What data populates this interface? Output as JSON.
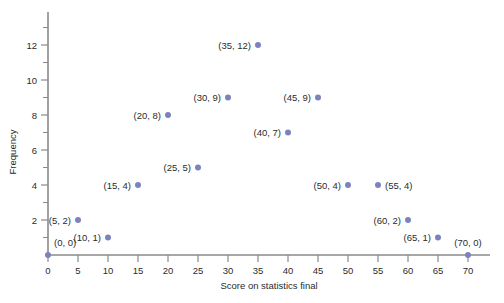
{
  "chart_data": {
    "type": "scatter",
    "title": "",
    "xlabel": "Score on statistics final",
    "ylabel": "Frequency",
    "xlim": [
      0,
      72
    ],
    "ylim": [
      0,
      13.5
    ],
    "grid": false,
    "legend": null,
    "x_ticks": [
      0,
      5,
      10,
      15,
      20,
      25,
      30,
      35,
      40,
      45,
      50,
      55,
      60,
      65,
      70
    ],
    "x_tick_labels": [
      "0",
      "5",
      "10",
      "15",
      "20",
      "25",
      "30",
      "35",
      "40",
      "45",
      "50",
      "55",
      "60",
      "65",
      "70"
    ],
    "y_ticks": [
      2,
      4,
      6,
      8,
      10,
      12
    ],
    "y_tick_labels": [
      "2",
      "4",
      "6",
      "8",
      "10",
      "12"
    ],
    "y_minor_ticks": [
      1,
      3,
      5,
      7,
      9,
      11,
      13
    ],
    "marker_color": "#7d82bf",
    "axis_color": "#8a8a8a",
    "text_color": "#2b2b2b",
    "points": [
      {
        "x": 0,
        "y": 0,
        "label": "(0, 0)",
        "label_side": "above-right"
      },
      {
        "x": 5,
        "y": 2,
        "label": "(5, 2)",
        "label_side": "left"
      },
      {
        "x": 10,
        "y": 1,
        "label": "(10, 1)",
        "label_side": "left"
      },
      {
        "x": 15,
        "y": 4,
        "label": "(15, 4)",
        "label_side": "left"
      },
      {
        "x": 20,
        "y": 8,
        "label": "(20, 8)",
        "label_side": "left"
      },
      {
        "x": 25,
        "y": 5,
        "label": "(25, 5)",
        "label_side": "left"
      },
      {
        "x": 30,
        "y": 9,
        "label": "(30, 9)",
        "label_side": "left"
      },
      {
        "x": 35,
        "y": 12,
        "label": "(35, 12)",
        "label_side": "left"
      },
      {
        "x": 40,
        "y": 7,
        "label": "(40, 7)",
        "label_side": "left"
      },
      {
        "x": 45,
        "y": 9,
        "label": "(45, 9)",
        "label_side": "left"
      },
      {
        "x": 50,
        "y": 4,
        "label": "(50, 4)",
        "label_side": "left"
      },
      {
        "x": 55,
        "y": 4,
        "label": "(55, 4)",
        "label_side": "right"
      },
      {
        "x": 60,
        "y": 2,
        "label": "(60, 2)",
        "label_side": "left"
      },
      {
        "x": 65,
        "y": 1,
        "label": "(65, 1)",
        "label_side": "left"
      },
      {
        "x": 70,
        "y": 0,
        "label": "(70, 0)",
        "label_side": "above"
      }
    ]
  }
}
